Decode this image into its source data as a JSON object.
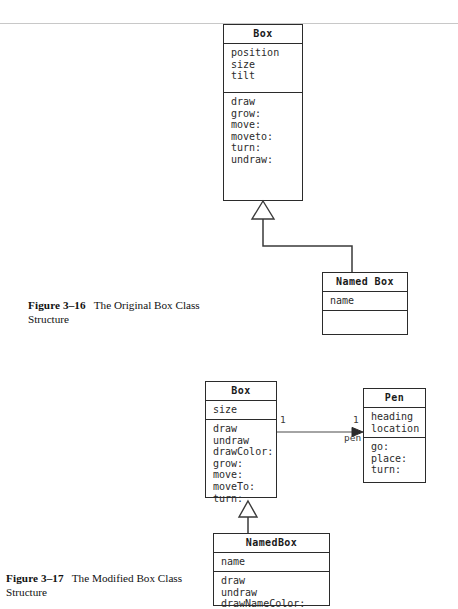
{
  "page": {
    "rule_top_y": 23
  },
  "figure_3_16": {
    "caption_number": "Figure 3–16",
    "caption_text": "The Original Box Class Structure",
    "caption_line1": "The Original Box Class",
    "caption_line2": "Structure",
    "classes": [
      {
        "id": "box",
        "name": "Box",
        "attributes": [
          "position",
          "size",
          "tilt"
        ],
        "operations": [
          "draw",
          "grow:",
          "move:",
          "moveto:",
          "turn:",
          "undraw:"
        ]
      },
      {
        "id": "named-box",
        "name": "Named Box",
        "attributes": [
          "name"
        ],
        "operations": []
      }
    ],
    "relationships": [
      {
        "kind": "generalization",
        "from": "named-box",
        "to": "box",
        "arrow": "hollow-triangle"
      }
    ]
  },
  "figure_3_17": {
    "caption_number": "Figure 3–17",
    "caption_text": "The Modified Box Class Structure",
    "caption_line1": "The Modified Box Class",
    "caption_line2": "Structure",
    "classes": [
      {
        "id": "box",
        "name": "Box",
        "attributes": [
          "size"
        ],
        "operations": [
          "draw",
          "undraw",
          "drawColor:",
          "grow:",
          "move:",
          "moveTo:",
          "turn:"
        ]
      },
      {
        "id": "pen",
        "name": "Pen",
        "attributes": [
          "heading",
          "location"
        ],
        "operations": [
          "go:",
          "place:",
          "turn:"
        ]
      },
      {
        "id": "named-box",
        "name": "NamedBox",
        "attributes": [
          "name"
        ],
        "operations": [
          "draw",
          "undraw",
          "drawNameColor:"
        ]
      }
    ],
    "relationships": [
      {
        "kind": "association",
        "from": "box",
        "to": "pen",
        "source_multiplicity": "1",
        "target_multiplicity": "1",
        "role_name": "pen",
        "arrow": "solid-arrowhead"
      },
      {
        "kind": "generalization",
        "from": "named-box",
        "to": "box",
        "arrow": "hollow-triangle"
      }
    ]
  },
  "colors": {
    "line": "#3a3a3a",
    "border": "#2b2b2b",
    "text": "#1a1a1a",
    "rule": "#c8c8c8",
    "background": "#ffffff"
  }
}
